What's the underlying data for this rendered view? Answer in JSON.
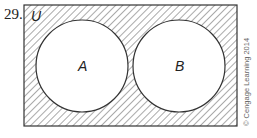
{
  "problem_number": "29.",
  "diagram": {
    "type": "venn",
    "universe_label": "U",
    "sets": [
      {
        "label": "A",
        "cx": 82,
        "cy": 66,
        "r": 46
      },
      {
        "label": "B",
        "cx": 179,
        "cy": 66,
        "r": 46
      }
    ],
    "shaded_region": "outside A and B",
    "hatch_color": "#555555"
  },
  "copyright": "© Cengage Learning 2014"
}
